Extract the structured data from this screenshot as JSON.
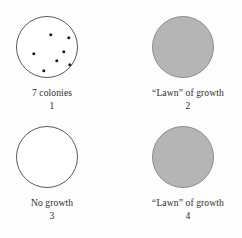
{
  "figure": {
    "type": "petri-dish-diagram",
    "background_color": "#fdfdfd",
    "text_color": "#2e2e2e",
    "dish_outline_color": "#5a5a5a",
    "growth_fill_color": "#b5b5b5",
    "colony_color": "#181818"
  },
  "panels": [
    {
      "number": "1",
      "caption": "7 colonies",
      "growth": "colonies",
      "colony_count": 7,
      "colonies": [
        {
          "cx": 34,
          "cy": 18
        },
        {
          "cx": 52,
          "cy": 21
        },
        {
          "cx": 17,
          "cy": 37
        },
        {
          "cx": 47,
          "cy": 35
        },
        {
          "cx": 40,
          "cy": 44
        },
        {
          "cx": 53,
          "cy": 48
        },
        {
          "cx": 27,
          "cy": 54
        }
      ]
    },
    {
      "number": "2",
      "caption": "“Lawn” of growth",
      "growth": "lawn",
      "colony_count": 0,
      "colonies": []
    },
    {
      "number": "3",
      "caption": "No growth",
      "growth": "none",
      "colony_count": 0,
      "colonies": []
    },
    {
      "number": "4",
      "caption": "“Lawn” of growth",
      "growth": "lawn",
      "colony_count": 0,
      "colonies": []
    }
  ]
}
